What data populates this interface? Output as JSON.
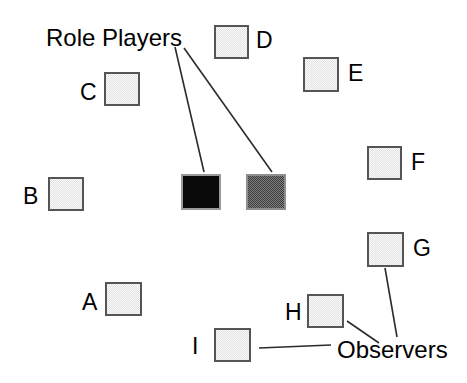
{
  "diagram": {
    "canvas": {
      "width": 467,
      "height": 383
    },
    "colors": {
      "background": "#ffffff",
      "box_border": "#555555",
      "observer_fill": "#e2e2e2",
      "role_player_black_fill": "#0a0a0a",
      "role_player_dark_fill": "#3d3d3d",
      "line": "#2b2b2b",
      "text": "#000000"
    },
    "group_labels": [
      {
        "id": "role-players",
        "text": "Role Players",
        "x": 46,
        "y": 25
      },
      {
        "id": "observers",
        "text": "Observers",
        "x": 337,
        "y": 337
      }
    ],
    "nodes": [
      {
        "id": "A",
        "label": "A",
        "group": "observers",
        "fill": "light",
        "box": {
          "x": 105,
          "y": 282,
          "w": 37,
          "h": 34
        },
        "label_pos": {
          "x": 82,
          "y": 291
        }
      },
      {
        "id": "B",
        "label": "B",
        "group": "observers",
        "fill": "light",
        "box": {
          "x": 48,
          "y": 177,
          "w": 36,
          "h": 34
        },
        "label_pos": {
          "x": 23,
          "y": 185
        }
      },
      {
        "id": "C",
        "label": "C",
        "group": "observers",
        "fill": "light",
        "box": {
          "x": 104,
          "y": 72,
          "w": 36,
          "h": 34
        },
        "label_pos": {
          "x": 80,
          "y": 81
        }
      },
      {
        "id": "D",
        "label": "D",
        "group": "observers",
        "fill": "light",
        "box": {
          "x": 214,
          "y": 25,
          "w": 35,
          "h": 34
        },
        "label_pos": {
          "x": 256,
          "y": 29
        }
      },
      {
        "id": "E",
        "label": "E",
        "group": "observers",
        "fill": "light",
        "box": {
          "x": 303,
          "y": 57,
          "w": 36,
          "h": 35
        },
        "label_pos": {
          "x": 348,
          "y": 62
        }
      },
      {
        "id": "F",
        "label": "F",
        "group": "observers",
        "fill": "light",
        "box": {
          "x": 367,
          "y": 146,
          "w": 35,
          "h": 34
        },
        "label_pos": {
          "x": 411,
          "y": 151
        }
      },
      {
        "id": "G",
        "label": "G",
        "group": "observers",
        "fill": "light",
        "box": {
          "x": 367,
          "y": 232,
          "w": 37,
          "h": 35
        },
        "label_pos": {
          "x": 413,
          "y": 237
        }
      },
      {
        "id": "H",
        "label": "H",
        "group": "observers",
        "fill": "light",
        "box": {
          "x": 307,
          "y": 294,
          "w": 37,
          "h": 34
        },
        "label_pos": {
          "x": 285,
          "y": 301
        }
      },
      {
        "id": "I",
        "label": "I",
        "group": "observers",
        "fill": "light",
        "box": {
          "x": 214,
          "y": 328,
          "w": 37,
          "h": 34
        },
        "label_pos": {
          "x": 192,
          "y": 335
        }
      },
      {
        "id": "RP1",
        "label": "",
        "group": "role-players",
        "fill": "black",
        "box": {
          "x": 181,
          "y": 174,
          "w": 40,
          "h": 36
        },
        "label_pos": null
      },
      {
        "id": "RP2",
        "label": "",
        "group": "role-players",
        "fill": "dark",
        "box": {
          "x": 246,
          "y": 174,
          "w": 40,
          "h": 36
        },
        "label_pos": null
      }
    ],
    "leader_lines": [
      {
        "id": "role-players-to-rp1",
        "x1": 175,
        "y1": 47,
        "x2": 204,
        "y2": 172
      },
      {
        "id": "role-players-to-rp2",
        "x1": 184,
        "y1": 48,
        "x2": 272,
        "y2": 172
      },
      {
        "id": "observers-to-g",
        "x1": 385,
        "y1": 268,
        "x2": 397,
        "y2": 337
      },
      {
        "id": "observers-to-h",
        "x1": 347,
        "y1": 321,
        "x2": 379,
        "y2": 343
      },
      {
        "id": "observers-to-i",
        "x1": 259,
        "y1": 348,
        "x2": 331,
        "y2": 345
      }
    ]
  }
}
